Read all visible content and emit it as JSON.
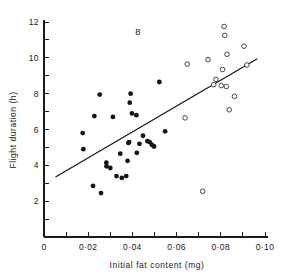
{
  "figure": {
    "label": "8",
    "label_x": 0.0425,
    "label_y": 11.3
  },
  "chart_data": {
    "type": "scatter",
    "title": "",
    "xlabel": "Initial fat content (mg)",
    "ylabel": "Flight duration (h)",
    "xlim": [
      0,
      0.1
    ],
    "ylim": [
      0,
      12
    ],
    "grid": false,
    "legend": "none",
    "x_ticks": [
      0,
      0.01,
      0.02,
      0.03,
      0.04,
      0.05,
      0.06,
      0.07,
      0.08,
      0.09,
      0.1
    ],
    "x_tick_labels": [
      "0",
      "",
      "0·02",
      "",
      "0·04",
      "",
      "0·06",
      "",
      "0·08",
      "",
      "0·10"
    ],
    "y_ticks": [
      0,
      1,
      2,
      3,
      4,
      5,
      6,
      7,
      8,
      9,
      10,
      11,
      12
    ],
    "y_tick_labels": [
      "",
      "",
      "2",
      "",
      "4",
      "",
      "6",
      "",
      "8",
      "",
      "10",
      "",
      "12"
    ],
    "series": [
      {
        "name": "filled-points",
        "marker": "filled-circle",
        "color": "#141414",
        "points": [
          [
            0.0175,
            5.8
          ],
          [
            0.0178,
            4.9
          ],
          [
            0.0222,
            2.85
          ],
          [
            0.0228,
            6.75
          ],
          [
            0.0252,
            7.95
          ],
          [
            0.0258,
            2.45
          ],
          [
            0.0282,
            4.15
          ],
          [
            0.0283,
            3.95
          ],
          [
            0.03,
            3.85
          ],
          [
            0.0312,
            6.7
          ],
          [
            0.0328,
            3.4
          ],
          [
            0.0345,
            4.65
          ],
          [
            0.0352,
            3.3
          ],
          [
            0.0372,
            3.4
          ],
          [
            0.0378,
            4.25
          ],
          [
            0.0385,
            5.3
          ],
          [
            0.0382,
            5.25
          ],
          [
            0.0388,
            7.5
          ],
          [
            0.0392,
            8.0
          ],
          [
            0.0398,
            6.9
          ],
          [
            0.0418,
            6.8
          ],
          [
            0.042,
            4.7
          ],
          [
            0.0432,
            5.2
          ],
          [
            0.0448,
            5.65
          ],
          [
            0.0468,
            5.35
          ],
          [
            0.0478,
            5.3
          ],
          [
            0.0488,
            5.15
          ],
          [
            0.0498,
            5.05
          ],
          [
            0.0522,
            8.65
          ],
          [
            0.0548,
            5.9
          ]
        ]
      },
      {
        "name": "open-points",
        "marker": "open-circle",
        "color": "#333333",
        "points": [
          [
            0.0638,
            6.65
          ],
          [
            0.0648,
            9.65
          ],
          [
            0.0718,
            2.55
          ],
          [
            0.0742,
            9.9
          ],
          [
            0.0768,
            8.5
          ],
          [
            0.0778,
            8.8
          ],
          [
            0.0802,
            8.45
          ],
          [
            0.0808,
            9.35
          ],
          [
            0.0815,
            11.75
          ],
          [
            0.0818,
            11.25
          ],
          [
            0.0825,
            8.4
          ],
          [
            0.0828,
            10.2
          ],
          [
            0.0838,
            7.1
          ],
          [
            0.0862,
            7.85
          ],
          [
            0.0905,
            10.65
          ],
          [
            0.0918,
            9.6
          ]
        ]
      }
    ],
    "fit_line": {
      "name": "regression-line",
      "x_start": 0.0052,
      "y_start": 3.35,
      "x_end": 0.0965,
      "y_end": 9.95
    }
  }
}
